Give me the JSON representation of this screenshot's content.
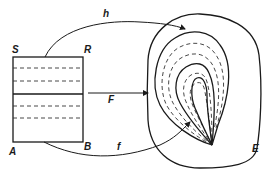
{
  "diagram": {
    "type": "mapping-diagram",
    "labels": {
      "top_left": "S",
      "top_right": "R",
      "bottom_left": "A",
      "bottom_right": "B",
      "top_arrow": "h",
      "middle_arrow": "F",
      "bottom_arrow": "f",
      "region": "E"
    },
    "colors": {
      "ink": "#1a1a1a",
      "background": "#ffffff"
    }
  }
}
